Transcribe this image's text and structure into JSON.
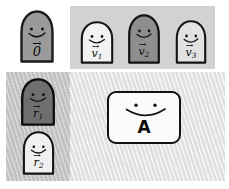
{
  "figure": {
    "title": ""
  },
  "panels": {
    "zero": {
      "name": "zero-vector-panel",
      "background_color": "#ffffff",
      "blobs": [
        {
          "id": "blob-zero",
          "label_symbol": "0",
          "label_subscript": "",
          "has_vector_arrow": true,
          "fill_color": "#9a9a9a",
          "stroke_color": "#1a1a1a",
          "expression": "0⃗"
        }
      ]
    },
    "vectors": {
      "name": "vectors-panel",
      "background_color": "#d2d2d2",
      "blobs": [
        {
          "id": "blob-v1",
          "label_symbol": "v",
          "label_subscript": "1",
          "has_vector_arrow": true,
          "fill_color": "#f2f2f2",
          "stroke_color": "#141414",
          "expression": "v⃗1"
        },
        {
          "id": "blob-v2",
          "label_symbol": "v",
          "label_subscript": "2",
          "has_vector_arrow": true,
          "fill_color": "#8e8e8e",
          "stroke_color": "#121212",
          "expression": "v⃗2"
        },
        {
          "id": "blob-v3",
          "label_symbol": "v",
          "label_subscript": "3",
          "has_vector_arrow": true,
          "fill_color": "#e2e2e2",
          "stroke_color": "#141414",
          "expression": "v⃗3"
        }
      ]
    },
    "residuals": {
      "name": "residuals-panel",
      "background_color": "#c9c9c9",
      "blobs": [
        {
          "id": "blob-r1",
          "label_symbol": "r",
          "label_subscript": "1",
          "has_vector_arrow": true,
          "fill_color": "#6f6f6f",
          "stroke_color": "#0d0d0d",
          "expression": "r⃗1"
        },
        {
          "id": "blob-r2",
          "label_symbol": "r",
          "label_subscript": "2",
          "has_vector_arrow": true,
          "fill_color": "#f0f0f0",
          "stroke_color": "#141414",
          "expression": "r⃗2"
        }
      ]
    },
    "agent": {
      "name": "agent-panel",
      "background_color": "#ececec",
      "card": {
        "id": "agent-card",
        "label": "A",
        "fill_color": "#fbfbfb",
        "stroke_color": "#121212",
        "has_face": true
      }
    }
  },
  "colors": {
    "ink": "#111111",
    "panel_light": "#ececec",
    "panel_mid": "#d2d2d2",
    "panel_dark": "#c9c9c9"
  }
}
